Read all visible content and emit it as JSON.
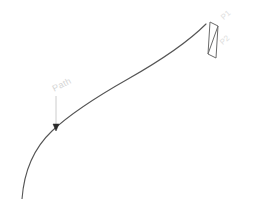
{
  "diagram": {
    "background_color": "#ffffff",
    "stroke_color": "#555555",
    "label_color": "#dedede",
    "leader_color": "#cccccc",
    "arrow_color": "#2b2b2b",
    "labels": {
      "path": "Path",
      "p1": "P1",
      "p2": "P2"
    },
    "elements": {
      "path_curve_name": "path-curve",
      "profile_name": "profile-parallelogram",
      "leader_name": "path-leader-line",
      "arrow_name": "path-leader-arrowhead"
    }
  }
}
